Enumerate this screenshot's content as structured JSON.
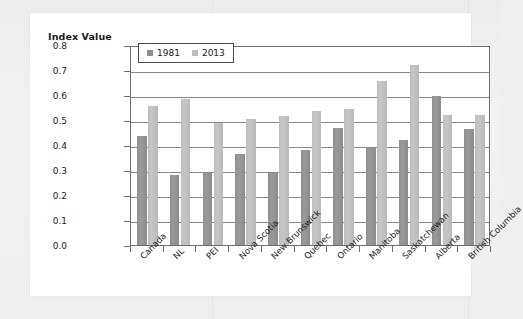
{
  "card": {
    "axis_title": "Index Value"
  },
  "chart_data": {
    "type": "bar",
    "title": "",
    "subtitle": "",
    "xlabel": "",
    "ylabel": "Index Value",
    "ylim": [
      0.0,
      0.8
    ],
    "yticks": [
      "0.0",
      "0.1",
      "0.2",
      "0.3",
      "0.4",
      "0.5",
      "0.6",
      "0.7",
      "0.8"
    ],
    "ytick_values": [
      0.0,
      0.1,
      0.2,
      0.3,
      0.4,
      0.5,
      0.6,
      0.7,
      0.8
    ],
    "grid": true,
    "legend_position": "top-left-inside",
    "categories": [
      "Canada",
      "NL",
      "PEI",
      "Nova Scotia",
      "New Brunswick",
      "Quebec",
      "Ontario",
      "Manitoba",
      "Saskatchewan",
      "Alberta",
      "British Columbia"
    ],
    "series": [
      {
        "name": "1981",
        "color": "#8f8f8f",
        "values": [
          0.435,
          0.28,
          0.29,
          0.365,
          0.29,
          0.38,
          0.47,
          0.39,
          0.42,
          0.595,
          0.465
        ]
      },
      {
        "name": "2013",
        "color": "#bdbdbd",
        "values": [
          0.555,
          0.585,
          0.49,
          0.505,
          0.515,
          0.535,
          0.545,
          0.655,
          0.72,
          0.52,
          0.52
        ]
      }
    ]
  }
}
